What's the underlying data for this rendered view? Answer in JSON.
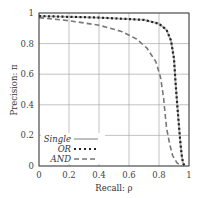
{
  "chart_data": {
    "type": "line",
    "title": "",
    "xlabel": "Recall: ρ",
    "ylabel": "Precision: π",
    "xlim": [
      0,
      1
    ],
    "ylim": [
      0,
      1
    ],
    "grid": true,
    "legend_position": "lower-left",
    "xticks": [
      "0",
      "0.2",
      "0.4",
      "0.6",
      "0.8",
      "1"
    ],
    "yticks": [
      "0",
      "0.2",
      "0.4",
      "0.6",
      "0.8",
      "1"
    ],
    "series": [
      {
        "name": "Single",
        "style": "solid",
        "color": "#b0b0b0",
        "x": [
          0.0,
          0.2,
          0.4,
          0.6,
          0.7,
          0.8,
          0.85,
          0.88,
          0.9,
          0.91,
          0.92,
          0.93,
          0.94,
          0.95,
          0.96,
          0.97
        ],
        "y": [
          0.98,
          0.975,
          0.97,
          0.96,
          0.955,
          0.93,
          0.89,
          0.82,
          0.7,
          0.55,
          0.42,
          0.3,
          0.18,
          0.08,
          0.02,
          0.0
        ]
      },
      {
        "name": "OR",
        "style": "dotted",
        "color": "#222222",
        "x": [
          0.0,
          0.2,
          0.4,
          0.6,
          0.7,
          0.8,
          0.85,
          0.88,
          0.9,
          0.91,
          0.92,
          0.93,
          0.94,
          0.95,
          0.96,
          0.97
        ],
        "y": [
          0.98,
          0.975,
          0.97,
          0.96,
          0.955,
          0.93,
          0.89,
          0.82,
          0.7,
          0.55,
          0.42,
          0.3,
          0.18,
          0.08,
          0.02,
          0.0
        ]
      },
      {
        "name": "AND",
        "style": "dashed",
        "color": "#777777",
        "x": [
          0.0,
          0.2,
          0.4,
          0.55,
          0.65,
          0.72,
          0.78,
          0.81,
          0.83,
          0.84,
          0.85,
          0.87,
          0.89,
          0.92,
          0.95
        ],
        "y": [
          0.97,
          0.95,
          0.92,
          0.88,
          0.83,
          0.77,
          0.68,
          0.58,
          0.45,
          0.35,
          0.25,
          0.15,
          0.07,
          0.02,
          0.0
        ]
      }
    ]
  },
  "legend": {
    "items": [
      {
        "label": "Single"
      },
      {
        "label": "OR"
      },
      {
        "label": "AND"
      }
    ]
  },
  "axes": {
    "xlabel": "Recall: ρ",
    "ylabel": "Precision: π"
  }
}
